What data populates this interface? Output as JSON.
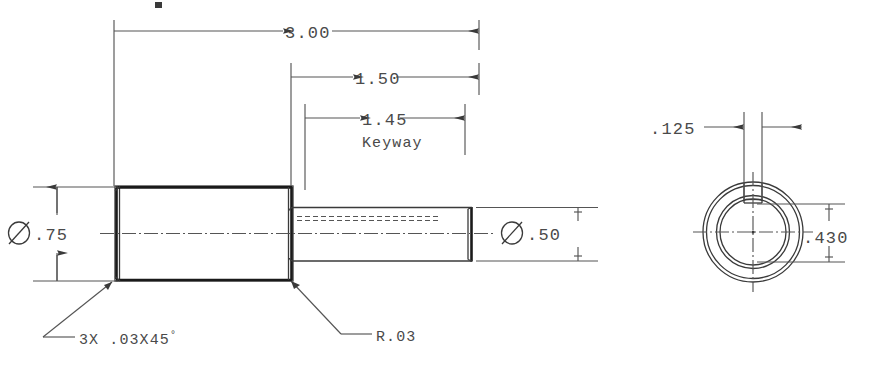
{
  "drawing": {
    "title": "stepped-shaft-with-keyway",
    "type": "mechanical-engineering-drawing",
    "background_color": "#ffffff",
    "line_color": "#2c2c2c",
    "text_color": "#4a4a4a"
  },
  "dimensions": {
    "overall_length": "3.00",
    "small_section_length": "1.50",
    "keyway_length": "1.45",
    "keyway_label": "Keyway",
    "large_diameter": "Ø.75",
    "small_diameter": "Ø.50",
    "keyway_width": ".125",
    "keyway_depth_dim": ".430"
  },
  "callouts": {
    "chamfer": "3X .03X45",
    "chamfer_degree_symbol": "°",
    "fillet_radius": "R.03"
  },
  "views": {
    "side_view_name": "side-elevation-view",
    "section_view_name": "end-section-view"
  }
}
